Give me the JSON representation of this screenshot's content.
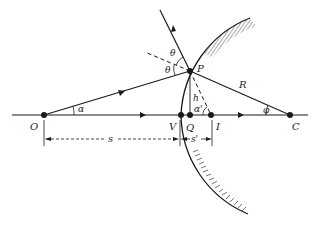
{
  "diagram": {
    "colors": {
      "ink": "#1a1a1a",
      "hatch": "#555555",
      "background": "#ffffff"
    },
    "points": {
      "O": {
        "label": "O",
        "x": 44,
        "y": 115
      },
      "V": {
        "label": "V",
        "x": 181,
        "y": 115
      },
      "Q": {
        "label": "Q",
        "x": 190,
        "y": 115
      },
      "I": {
        "label": "I",
        "x": 211,
        "y": 115
      },
      "C": {
        "label": "C",
        "x": 290,
        "y": 115
      },
      "P": {
        "label": "P",
        "x": 190,
        "y": 71
      }
    },
    "labels": {
      "alpha": "α",
      "alpha_prime": "α'",
      "phi": "φ",
      "theta_upper": "θ",
      "theta_lower": "θ",
      "h": "h",
      "R": "R",
      "s": "s",
      "s_prime": "s'"
    },
    "dimensions": [
      {
        "name": "s",
        "from": "O",
        "to": "V"
      },
      {
        "name": "s'",
        "from": "V",
        "to": "I"
      }
    ]
  }
}
